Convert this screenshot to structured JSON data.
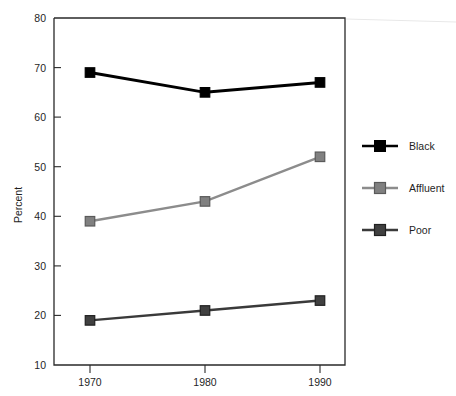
{
  "chart_data": {
    "type": "line",
    "title": "",
    "xlabel": "",
    "ylabel": "Percent",
    "x": [
      1970,
      1980,
      1990
    ],
    "categories": [
      "1970",
      "1980",
      "1990"
    ],
    "series": [
      {
        "name": "Black",
        "values": [
          69,
          65,
          67
        ],
        "color": "#000000"
      },
      {
        "name": "Affluent",
        "values": [
          39,
          43,
          52
        ],
        "color": "#808080"
      },
      {
        "name": "Poor",
        "values": [
          19,
          21,
          23
        ],
        "color": "#404040"
      }
    ],
    "ylim": [
      10,
      80
    ],
    "yticks": [
      10,
      20,
      30,
      40,
      50,
      60,
      70,
      80
    ],
    "ytick_labels": [
      "10",
      "20",
      "30",
      "40",
      "50",
      "60",
      "70",
      "80"
    ],
    "xtick_labels": [
      "1970",
      "1980",
      "1990"
    ],
    "grid": false,
    "legend_position": "right",
    "marker": "square"
  },
  "axes": {
    "y_title": "Percent",
    "y_ticks": [
      "80",
      "70",
      "60",
      "50",
      "40",
      "30",
      "20",
      "10"
    ],
    "x_ticks": [
      "1970",
      "1980",
      "1990"
    ]
  },
  "legend": {
    "items": [
      {
        "label": "Black"
      },
      {
        "label": "Affluent"
      },
      {
        "label": "Poor"
      }
    ]
  }
}
